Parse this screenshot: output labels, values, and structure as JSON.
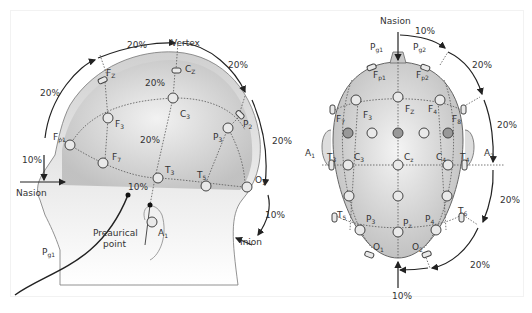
{
  "side_view": {
    "percent_labels": {
      "top_left": "20%",
      "left_upper": "20%",
      "right_upper": "20%",
      "right_mid": "20%",
      "inner_top": "20%",
      "inner_mid": "20%",
      "front_low": "10%",
      "back_low": "10%",
      "ear": "10%"
    },
    "landmarks": {
      "vertex": "Vertex",
      "nasion": "Nasion",
      "inion": "Inion",
      "preaurical_line1": "Preaurical",
      "preaurical_line2": "point"
    },
    "electrodes": {
      "fz": "F",
      "fz_sub": "Z",
      "cz": "C",
      "cz_sub": "Z",
      "f3": "F",
      "f3_sub": "3",
      "c3": "C",
      "c3_sub": "3",
      "p3": "P",
      "p3_sub": "3",
      "p2": "P",
      "p2_sub": "2",
      "fp1": "F",
      "fp1_sub": "p1",
      "f7": "F",
      "f7_sub": "7",
      "t3": "T",
      "t3_sub": "3",
      "t5": "T",
      "t5_sub": "5",
      "o1": "O",
      "o1_sub": "1",
      "a1": "A",
      "a1_sub": "1",
      "pg1": "P",
      "pg1_sub": "g1"
    }
  },
  "top_view": {
    "percent_labels": {
      "top": "10%",
      "r1": "20%",
      "r2": "20%",
      "r3": "20%",
      "r4": "20%",
      "bottom": "10%"
    },
    "landmarks": {
      "nasion": "Nasion"
    },
    "electrodes": {
      "pg1": "P",
      "pg1_sub": "g1",
      "pg2": "P",
      "pg2_sub": "g2",
      "fp1": "F",
      "fp1_sub": "p1",
      "fp2": "F",
      "fp2_sub": "p2",
      "f7": "F",
      "f7_sub": "7",
      "f3": "F",
      "f3_sub": "3",
      "fz": "F",
      "fz_sub": "Z",
      "f4": "F",
      "f4_sub": "4",
      "f8": "F",
      "f8_sub": "8",
      "a1": "A",
      "a1_sub": "1",
      "t3": "T",
      "t3_sub": "3",
      "c3": "C",
      "c3_sub": "3",
      "cz": "C",
      "cz_sub": "z",
      "c4": "C",
      "c4_sub": "4",
      "t4": "T",
      "t4_sub": "4",
      "a2": "A",
      "a2_sub": "2",
      "t5": "T",
      "t5_sub": "5",
      "p3": "P",
      "p3_sub": "3",
      "pz": "P",
      "pz_sub": "z",
      "p4": "P",
      "p4_sub": "4",
      "t6": "T",
      "t6_sub": "6",
      "o1": "O",
      "o1_sub": "1",
      "o2": "O",
      "o2_sub": "2"
    }
  }
}
